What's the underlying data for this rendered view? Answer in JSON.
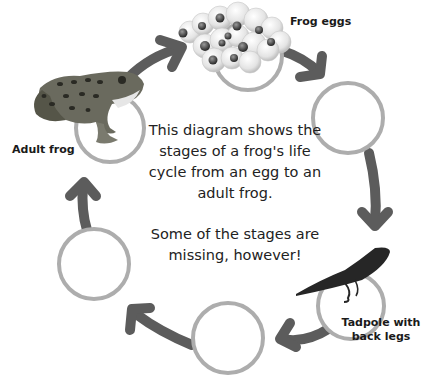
{
  "diagram": {
    "intro_text": "This diagram shows the stages of a frog's life cycle from an egg to an adult frog.",
    "note_text": "Some of the stages are missing, however!",
    "colors": {
      "arrow": "#5c5c5c",
      "circle": "#adadad",
      "text": "#1a1a1a",
      "background": "#ffffff"
    },
    "stages": [
      {
        "id": "eggs",
        "label": "Frog eggs",
        "image": "frog-eggs-cluster",
        "filled": true
      },
      {
        "id": "stage2",
        "label": "",
        "image": "",
        "filled": false
      },
      {
        "id": "tadpole-back-legs",
        "label_line1": "Tadpole with",
        "label_line2": "back legs",
        "image": "tadpole",
        "filled": true
      },
      {
        "id": "stage4",
        "label": "",
        "image": "",
        "filled": false
      },
      {
        "id": "stage5",
        "label": "",
        "image": "",
        "filled": false
      },
      {
        "id": "adult",
        "label": "Adult frog",
        "image": "leopard-frog",
        "filled": true
      }
    ]
  }
}
